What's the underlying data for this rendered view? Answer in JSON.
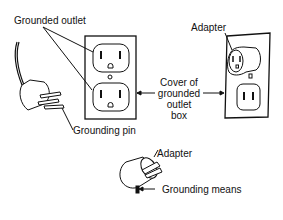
{
  "diagram": {
    "labels": {
      "grounded_outlet": "Grounded outlet",
      "grounding_pin": "Grounding pin",
      "adapter_top": "Adapter",
      "cover_line1": "Cover of",
      "cover_line2": "grounded",
      "cover_line3": "outlet",
      "cover_line4": "box",
      "adapter_bottom": "Adapter",
      "grounding_means": "Grounding means"
    },
    "colors": {
      "ink": "#111111",
      "background": "#ffffff"
    }
  }
}
